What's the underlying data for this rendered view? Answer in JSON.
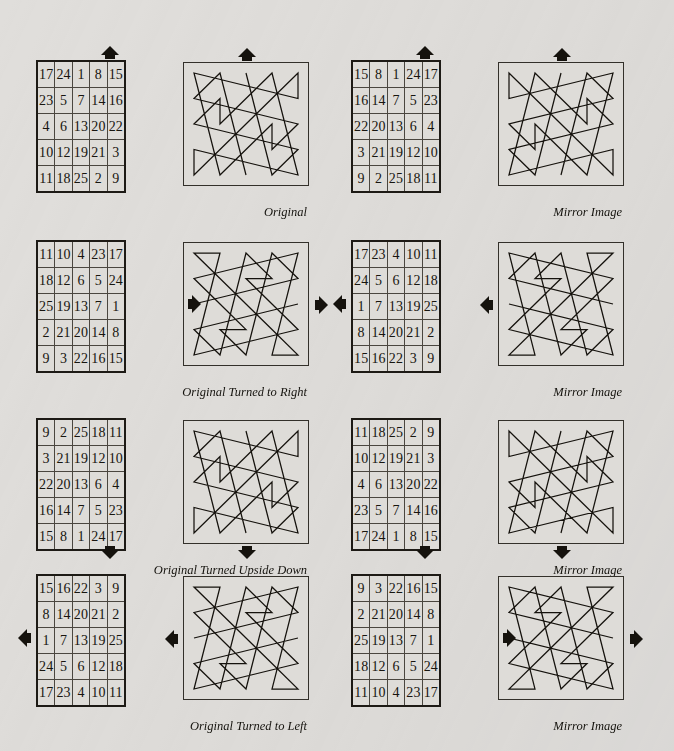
{
  "page": {
    "background_color": "#e0dedb",
    "ink_color": "#15120d",
    "grid_size": 5
  },
  "figures": [
    {
      "id": "original",
      "caption": "Original",
      "arrow": "up",
      "grid": [
        [
          17,
          24,
          1,
          8,
          15
        ],
        [
          23,
          5,
          7,
          14,
          16
        ],
        [
          4,
          6,
          13,
          20,
          22
        ],
        [
          10,
          12,
          19,
          21,
          3
        ],
        [
          11,
          18,
          25,
          2,
          9
        ]
      ]
    },
    {
      "id": "original-mirror",
      "caption": "Mirror Image",
      "arrow": "up",
      "grid": [
        [
          15,
          8,
          1,
          24,
          17
        ],
        [
          16,
          14,
          7,
          5,
          23
        ],
        [
          22,
          20,
          13,
          6,
          4
        ],
        [
          3,
          21,
          19,
          12,
          10
        ],
        [
          9,
          2,
          25,
          18,
          11
        ]
      ]
    },
    {
      "id": "turned-right",
      "caption": "Original Turned to Right",
      "arrow": "right",
      "grid": [
        [
          11,
          10,
          4,
          23,
          17
        ],
        [
          18,
          12,
          6,
          5,
          24
        ],
        [
          25,
          19,
          13,
          7,
          1
        ],
        [
          2,
          21,
          20,
          14,
          8
        ],
        [
          9,
          3,
          22,
          16,
          15
        ]
      ]
    },
    {
      "id": "turned-right-mirror",
      "caption": "Mirror Image",
      "arrow": "left",
      "grid": [
        [
          17,
          23,
          4,
          10,
          11
        ],
        [
          24,
          5,
          6,
          12,
          18
        ],
        [
          1,
          7,
          13,
          19,
          25
        ],
        [
          8,
          14,
          20,
          21,
          2
        ],
        [
          15,
          16,
          22,
          3,
          9
        ]
      ]
    },
    {
      "id": "upside-down",
      "caption": "Original Turned Upside Down",
      "arrow": "down",
      "grid": [
        [
          9,
          2,
          25,
          18,
          11
        ],
        [
          3,
          21,
          19,
          12,
          10
        ],
        [
          22,
          20,
          13,
          6,
          4
        ],
        [
          16,
          14,
          7,
          5,
          23
        ],
        [
          15,
          8,
          1,
          24,
          17
        ]
      ]
    },
    {
      "id": "upside-down-mirror",
      "caption": "Mirror Image",
      "arrow": "down",
      "grid": [
        [
          11,
          18,
          25,
          2,
          9
        ],
        [
          10,
          12,
          19,
          21,
          3
        ],
        [
          4,
          6,
          13,
          20,
          22
        ],
        [
          23,
          5,
          7,
          14,
          16
        ],
        [
          17,
          24,
          1,
          8,
          15
        ]
      ]
    },
    {
      "id": "turned-left",
      "caption": "Original Turned to Left",
      "arrow": "left",
      "grid": [
        [
          15,
          16,
          22,
          3,
          9
        ],
        [
          8,
          14,
          20,
          21,
          2
        ],
        [
          1,
          7,
          13,
          19,
          25
        ],
        [
          24,
          5,
          6,
          12,
          18
        ],
        [
          17,
          23,
          4,
          10,
          11
        ]
      ]
    },
    {
      "id": "turned-left-mirror",
      "caption": "Mirror Image",
      "arrow": "right",
      "grid": [
        [
          9,
          3,
          22,
          16,
          15
        ],
        [
          2,
          21,
          20,
          14,
          8
        ],
        [
          25,
          19,
          13,
          7,
          1
        ],
        [
          18,
          12,
          6,
          5,
          24
        ],
        [
          11,
          10,
          4,
          23,
          17
        ]
      ]
    }
  ],
  "layout": {
    "columns": [
      36,
      351
    ],
    "rows": [
      60,
      240,
      418,
      574
    ],
    "panel_offset_x": 147,
    "panel_width": 124,
    "panel_height": 122,
    "cell_w": 29,
    "cell_h": 25
  }
}
